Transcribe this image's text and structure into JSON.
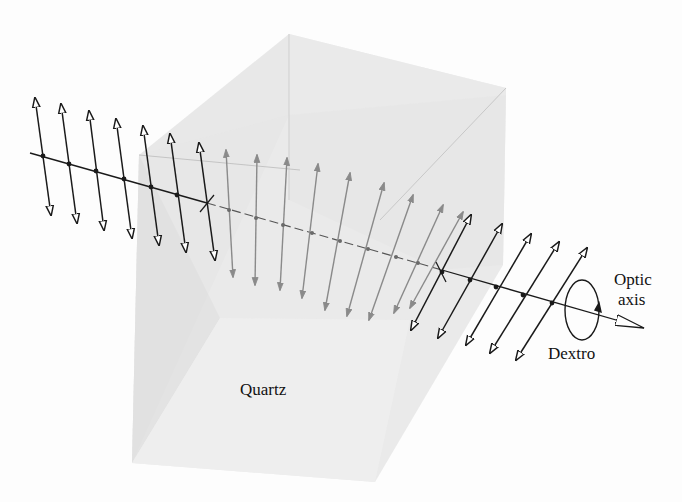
{
  "figure": {
    "labels": {
      "material": "Quartz",
      "axis_line1": "Optic",
      "axis_line2": "axis",
      "rotation": "Dextro"
    },
    "colors": {
      "background": "#fdfdfd",
      "crystal_face_light": "#eeeeee",
      "crystal_face_mid": "#e2e2e2",
      "crystal_face_dark": "#d6d6d6",
      "arrow_outside": "#1a1a1a",
      "arrow_inside": "#8a8a8a"
    },
    "incoming_vectors": 7,
    "inside_vectors": 9,
    "outgoing_vectors": 5
  }
}
